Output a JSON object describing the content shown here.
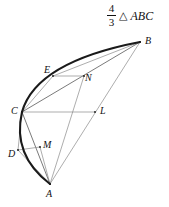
{
  "figure": {
    "caption": {
      "fraction_numerator": "4",
      "fraction_denominator": "3",
      "triangle_symbol": "△",
      "triangle_name": "ABC"
    },
    "colors": {
      "background": "#ffffff",
      "arc_stroke": "#1a1a1a",
      "chord_stroke": "#6b6b6b",
      "thin_stroke": "#8a8a8a",
      "label_text": "#111111"
    },
    "points": [
      {
        "id": "A",
        "label": "A",
        "x": 50,
        "y": 184,
        "label_x": 46,
        "label_y": 189
      },
      {
        "id": "B",
        "label": "B",
        "x": 140,
        "y": 42,
        "label_x": 145,
        "label_y": 36
      },
      {
        "id": "C",
        "label": "C",
        "x": 22,
        "y": 112,
        "label_x": 11,
        "label_y": 106
      },
      {
        "id": "D",
        "label": "D",
        "x": 18,
        "y": 150,
        "label_x": 8,
        "label_y": 149
      },
      {
        "id": "E",
        "label": "E",
        "x": 53,
        "y": 76,
        "label_x": 44,
        "label_y": 65
      },
      {
        "id": "L",
        "label": "L",
        "x": 95,
        "y": 112,
        "label_x": 100,
        "label_y": 106
      },
      {
        "id": "M",
        "label": "M",
        "x": 40,
        "y": 147,
        "label_x": 43,
        "label_y": 140
      },
      {
        "id": "N",
        "label": "N",
        "x": 84,
        "y": 76,
        "label_x": 85,
        "label_y": 73
      }
    ],
    "segments": [
      {
        "name": "chord-C-B",
        "from": "C",
        "to": "B",
        "weight": "chord"
      },
      {
        "name": "chord-C-A",
        "from": "C",
        "to": "A",
        "weight": "chord"
      },
      {
        "name": "chord-A-B",
        "from": "A",
        "to": "B",
        "weight": "thin"
      },
      {
        "name": "segment-C-E",
        "from": "C",
        "to": "E",
        "weight": "thin"
      },
      {
        "name": "segment-E-B",
        "from": "E",
        "to": "B",
        "weight": "thin"
      },
      {
        "name": "segment-E-N",
        "from": "E",
        "to": "N",
        "weight": "thin"
      },
      {
        "name": "segment-C-L",
        "from": "C",
        "to": "L",
        "weight": "thin"
      },
      {
        "name": "segment-C-D",
        "from": "C",
        "to": "D",
        "weight": "thin"
      },
      {
        "name": "segment-D-A",
        "from": "D",
        "to": "A",
        "weight": "thin"
      },
      {
        "name": "segment-D-M",
        "from": "D",
        "to": "M",
        "weight": "thin"
      },
      {
        "name": "segment-M-A",
        "from": "M",
        "to": "A",
        "weight": "thin"
      },
      {
        "name": "segment-A-N",
        "from": "A",
        "to": "N",
        "weight": "thin"
      }
    ],
    "arcs": [
      {
        "name": "parabola-arc-B-to-C",
        "from": "B",
        "to": "C",
        "control_x": 36,
        "control_y": 62,
        "weight": "arc"
      },
      {
        "name": "parabola-arc-C-to-A",
        "from": "C",
        "to": "A",
        "control_x": 12,
        "control_y": 155,
        "weight": "arc"
      }
    ]
  }
}
